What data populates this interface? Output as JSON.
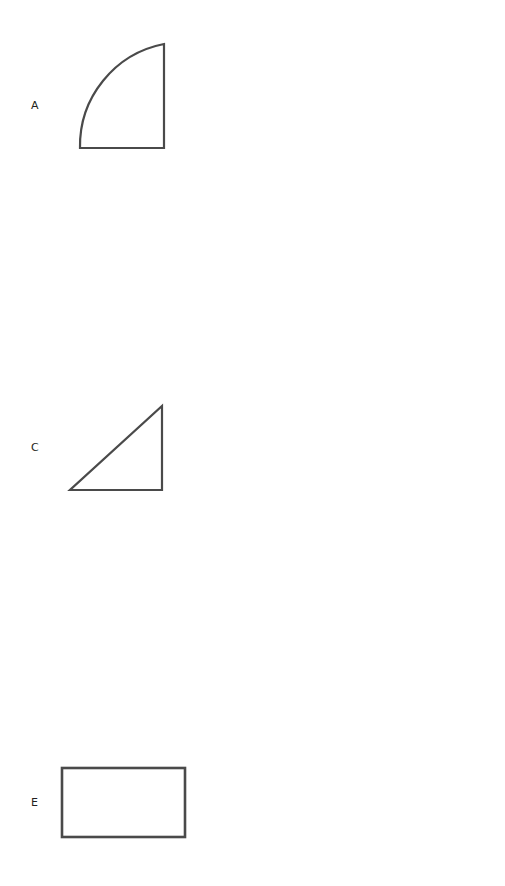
{
  "page": {
    "background_color": "#ffffff",
    "stroke_color": "#4a4a4a",
    "label_color": "#231f20",
    "width": 505,
    "height": 886
  },
  "shapes": [
    {
      "label": "A",
      "name": "quarter-circle",
      "description": "quarter circle with arc on upper left and right angle at bottom right",
      "label_x": 31,
      "label_y": 100,
      "box": {
        "x": 72,
        "y": 36,
        "width": 100,
        "height": 120
      },
      "stroke_width": 2.2
    },
    {
      "label": "B",
      "name": "triangle",
      "description": "isosceles triangle pointing up",
      "label_x": 311,
      "label_y": 100,
      "box": {
        "x": 338,
        "y": 56,
        "width": 138,
        "height": 100
      },
      "stroke_width": 2.2
    },
    {
      "label": "C",
      "name": "right-triangle",
      "description": "right triangle with right angle at bottom right",
      "label_x": 31,
      "label_y": 262,
      "box": {
        "x": 62,
        "y": 218,
        "width": 120,
        "height": 100
      },
      "stroke_width": 2.2
    },
    {
      "label": "D",
      "name": "square-rectangle",
      "description": "rectangle nearly square",
      "label_x": 311,
      "label_y": 262,
      "box": {
        "x": 354,
        "y": 232,
        "width": 92,
        "height": 78
      },
      "stroke_width": 2.4
    },
    {
      "label": "E",
      "name": "wide-rectangle",
      "description": "wide landscape rectangle",
      "label_x": 31,
      "label_y": 437,
      "box": {
        "x": 60,
        "y": 405,
        "width": 128,
        "height": 76
      },
      "stroke_width": 2.6
    },
    {
      "label": "F",
      "name": "parallelogram",
      "description": "parallelogram slanting to the right",
      "label_x": 311,
      "label_y": 437,
      "box": {
        "x": 340,
        "y": 405,
        "width": 138,
        "height": 78
      },
      "stroke_width": 2.4
    },
    {
      "label": "G",
      "name": "circle",
      "description": "circle",
      "label_x": 31,
      "label_y": 611,
      "box": {
        "x": 70,
        "y": 562,
        "width": 108,
        "height": 108
      },
      "stroke_width": 2.2
    },
    {
      "label": "H",
      "name": "rhombus-diamond",
      "description": "vertical rhombus diamond taller than wide",
      "label_x": 311,
      "label_y": 611,
      "box": {
        "x": 360,
        "y": 556,
        "width": 88,
        "height": 122
      },
      "stroke_width": 2.2
    },
    {
      "label": "I",
      "name": "chevron-arrow",
      "description": "chevron arrow pointing right",
      "label_x": 31,
      "label_y": 795,
      "box": {
        "x": 76,
        "y": 716,
        "width": 110,
        "height": 158
      },
      "stroke_width": 2.4
    },
    {
      "label": "J",
      "name": "right-trapezoid",
      "description": "right trapezoid with vertical left side and slanted right side",
      "label_x": 311,
      "label_y": 795,
      "box": {
        "x": 332,
        "y": 778,
        "width": 154,
        "height": 50
      },
      "stroke_width": 2.4
    }
  ]
}
